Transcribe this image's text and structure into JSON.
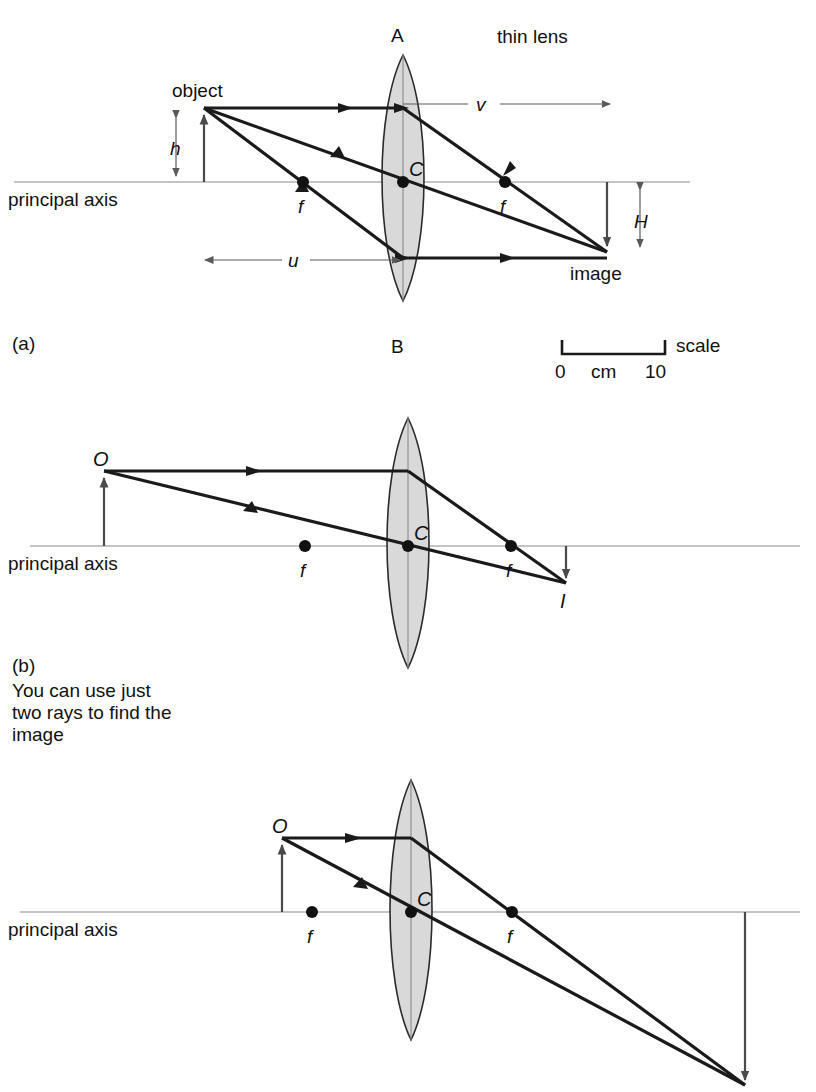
{
  "figure": {
    "title_note": "thin lens",
    "panels": [
      {
        "id": "a",
        "caption": "(a)",
        "labels": {
          "object": "object",
          "image": "image",
          "principal_axis": "principal axis",
          "lens_top": "A",
          "lens_bottom": "B",
          "lens_centre": "C",
          "focal_left": "f",
          "focal_right": "f",
          "object_height": "h",
          "image_height": "H",
          "object_distance": "u",
          "image_distance": "v"
        }
      },
      {
        "id": "b",
        "caption": "(b)",
        "note_lines": [
          "You can use just",
          "two rays to find the",
          "image"
        ],
        "labels": {
          "object_point": "O",
          "image_point": "I",
          "principal_axis": "principal axis",
          "lens_centre": "C",
          "focal_left": "f",
          "focal_right": "f"
        }
      },
      {
        "id": "c",
        "caption": "",
        "labels": {
          "object_point": "O",
          "principal_axis": "principal axis",
          "lens_centre": "C",
          "focal_left": "f",
          "focal_right": "f"
        }
      }
    ],
    "scale": {
      "label": "scale",
      "unit": "cm",
      "min": "0",
      "max": "10"
    },
    "colors": {
      "ray": "#1a1a1a",
      "axis": "#8a8a8a",
      "lens_fill": "#d9d9d9",
      "lens_stroke": "#2b2b2b",
      "text": "#111111"
    }
  }
}
